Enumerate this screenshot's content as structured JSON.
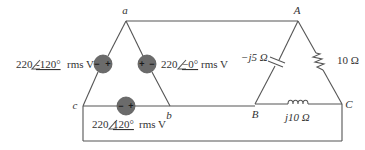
{
  "diagram": {
    "type": "circuit",
    "nodes": {
      "source": [
        "a",
        "b",
        "c"
      ],
      "load": [
        "A",
        "B",
        "C"
      ]
    },
    "sources": [
      {
        "id": "V_ca_source",
        "between": [
          "c",
          "a"
        ],
        "magnitude": "220",
        "angle": "-120°",
        "unit": "rms V",
        "polarity": "− +"
      },
      {
        "id": "V_ab_source",
        "between": [
          "a",
          "b"
        ],
        "magnitude": "220",
        "angle": "−0°",
        "unit": "rms V",
        "polarity": "+ −"
      },
      {
        "id": "V_bc_source",
        "between": [
          "c",
          "b"
        ],
        "magnitude": "220",
        "angle": "120°",
        "unit": "rms V",
        "polarity": "− +"
      }
    ],
    "load_elements": [
      {
        "id": "capacitor",
        "between": [
          "A",
          "B"
        ],
        "label": "−j5 Ω"
      },
      {
        "id": "resistor",
        "between": [
          "A",
          "C"
        ],
        "label": "10 Ω"
      },
      {
        "id": "inductor",
        "between": [
          "B",
          "C"
        ],
        "label": "j10 Ω"
      }
    ]
  },
  "labels": {
    "node_a": "a",
    "node_b": "b",
    "node_c": "c",
    "node_A": "A",
    "node_B": "B",
    "node_C": "C",
    "src_left_mag": "220",
    "src_left_angle": "-120°",
    "src_left_unit": "rms V",
    "src_right_mag": "220",
    "src_right_angle": "−0°",
    "src_right_unit": "rms V",
    "src_bottom_mag": "220",
    "src_bottom_angle": "120°",
    "src_bottom_unit": "rms V",
    "cap_label": "−j5 Ω",
    "res_label": "10 Ω",
    "ind_label": "j10 Ω",
    "plus": "+",
    "minus": "−"
  }
}
